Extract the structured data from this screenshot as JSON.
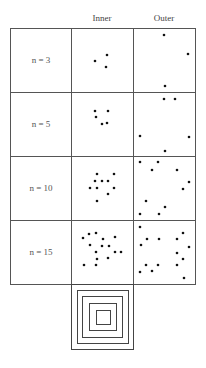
{
  "columns": [
    "Inner",
    "Outer"
  ],
  "rows": [
    {
      "label": "n = 3",
      "inner": [
        [
          95,
          61
        ],
        [
          107,
          55
        ],
        [
          106,
          67
        ]
      ],
      "outer": [
        [
          164,
          35
        ],
        [
          188,
          54
        ],
        [
          165,
          86
        ]
      ]
    },
    {
      "label": "n = 5",
      "inner": [
        [
          95,
          111
        ],
        [
          108,
          111
        ],
        [
          96,
          117
        ],
        [
          102,
          124
        ],
        [
          107,
          123
        ]
      ],
      "outer": [
        [
          164,
          99
        ],
        [
          175,
          99
        ],
        [
          140,
          136
        ],
        [
          189,
          137
        ],
        [
          165,
          151
        ]
      ]
    },
    {
      "label": "n = 10",
      "inner": [
        [
          97,
          174
        ],
        [
          114,
          174
        ],
        [
          95,
          181
        ],
        [
          102,
          181
        ],
        [
          108,
          181
        ],
        [
          90,
          188
        ],
        [
          97,
          188
        ],
        [
          114,
          188
        ],
        [
          108,
          194
        ],
        [
          97,
          201
        ]
      ],
      "outer": [
        [
          140,
          162
        ],
        [
          158,
          162
        ],
        [
          152,
          170
        ],
        [
          177,
          170
        ],
        [
          189,
          182
        ],
        [
          183,
          189
        ],
        [
          146,
          201
        ],
        [
          165,
          207
        ],
        [
          140,
          214
        ],
        [
          159,
          214
        ]
      ]
    },
    {
      "label": "n = 15",
      "inner": [
        [
          83,
          238
        ],
        [
          89,
          234
        ],
        [
          96,
          233
        ],
        [
          103,
          239
        ],
        [
          115,
          237
        ],
        [
          90,
          245
        ],
        [
          102,
          246
        ],
        [
          109,
          246
        ],
        [
          96,
          252
        ],
        [
          115,
          252
        ],
        [
          121,
          252
        ],
        [
          97,
          259
        ],
        [
          108,
          258
        ],
        [
          84,
          265
        ],
        [
          96,
          265
        ]
      ],
      "outer": [
        [
          140,
          227
        ],
        [
          183,
          233
        ],
        [
          147,
          239
        ],
        [
          159,
          239
        ],
        [
          177,
          239
        ],
        [
          141,
          245
        ],
        [
          189,
          247
        ],
        [
          177,
          253
        ],
        [
          183,
          259
        ],
        [
          146,
          265
        ],
        [
          158,
          265
        ],
        [
          177,
          265
        ],
        [
          140,
          272
        ],
        [
          152,
          271
        ],
        [
          184,
          278
        ]
      ]
    }
  ],
  "nested_squares_count": 5
}
